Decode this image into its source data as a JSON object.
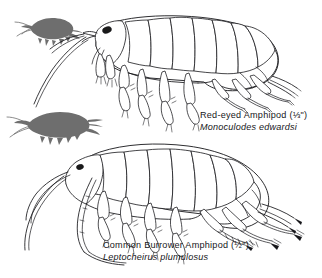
{
  "plate": {
    "background_color": "#ffffff",
    "ink_color": "#16161a",
    "silhouette_color": "#6e6e6e",
    "width": 322,
    "height": 278
  },
  "specimens": [
    {
      "id": "red-eyed-amphipod",
      "common_name": "Red-eyed Amphipod (⅓\")",
      "scientific_name": "Monoculodes edwardsi",
      "size_text": "⅓\"",
      "has_silhouette": true,
      "silhouette_label": "red-eyed-amphipod-silhouette",
      "eye_marking": "dark red eye"
    },
    {
      "id": "common-burrower-amphipod",
      "common_name": "Common Burrower Amphipod (½\")",
      "scientific_name": "Leptocheirus plumulosus",
      "size_text": "½\"",
      "has_silhouette": true,
      "silhouette_label": "common-burrower-amphipod-silhouette",
      "eye_marking": "dark eye"
    }
  ]
}
